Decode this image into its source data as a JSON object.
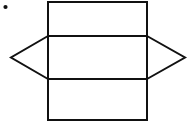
{
  "canvas": {
    "width": 193,
    "height": 128,
    "background_color": "#ffffff",
    "stroke_color": "#111111",
    "stroke_width": 2
  },
  "figure": {
    "rectangle": {
      "name": "main-rectangle",
      "left": 48,
      "top": 2,
      "right": 147,
      "bottom": 120,
      "width": 99,
      "height": 118
    },
    "divider_lines": [
      {
        "name": "upper-divider",
        "y": 36,
        "x_start": 48,
        "x_end": 147
      },
      {
        "name": "lower-divider",
        "y": 79,
        "x_start": 48,
        "x_end": 147
      }
    ],
    "left_triangle": {
      "name": "left-triangle",
      "apex": {
        "x": 11,
        "y": 57.5
      },
      "base_top": {
        "x": 48,
        "y": 36
      },
      "base_bottom": {
        "x": 48,
        "y": 79
      }
    },
    "right_triangle": {
      "name": "right-triangle",
      "apex": {
        "x": 185,
        "y": 57.5
      },
      "base_top": {
        "x": 147,
        "y": 36
      },
      "base_bottom": {
        "x": 147,
        "y": 79
      }
    },
    "marker_dot": {
      "name": "corner-dot",
      "cx": 5.5,
      "cy": 7,
      "r": 2.1,
      "color": "#111111"
    }
  },
  "paths": {
    "rectangle_d": "M 48 2 L 147 2 L 147 120 L 48 120 Z",
    "upper_divider_d": "M 48 36 L 147 36",
    "lower_divider_d": "M 48 79 L 147 79",
    "left_triangle_d": "M 48 36 L 11 57.5 L 48 79",
    "right_triangle_d": "M 147 36 L 185 57.5 L 147 79"
  }
}
